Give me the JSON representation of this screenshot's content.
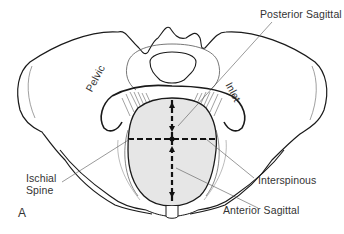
{
  "figure": {
    "panel_letter": "A",
    "colors": {
      "outline": "#1a1a1a",
      "inlet_fill": "#e6e6e6",
      "leader_line": "#555555",
      "text": "#333333"
    }
  },
  "labels": {
    "posterior_sagittal": "Posterior Sagittal",
    "interspinous": "Interspinous",
    "anterior_sagittal": "Anterior Sagittal",
    "ischial_spine_line1": "Ischial",
    "ischial_spine_line2": "Spine",
    "pelvic": "Pelvic",
    "inlet": "Inlet"
  }
}
